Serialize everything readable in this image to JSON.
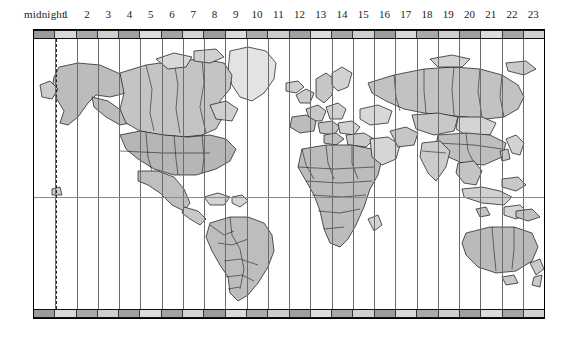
{
  "hour_axis": {
    "labels": [
      "midnight",
      "1",
      "2",
      "3",
      "4",
      "5",
      "6",
      "7",
      "8",
      "9",
      "10",
      "11",
      "12",
      "13",
      "14",
      "15",
      "16",
      "17",
      "18",
      "19",
      "20",
      "21",
      "22",
      "23"
    ],
    "count": 24,
    "first_label_text": "midnight"
  },
  "map": {
    "frame": {
      "x": 33,
      "y": 29,
      "width": 512,
      "height": 290
    },
    "timezone_band_count": 24,
    "equator_label": "equator",
    "date_line_label": "international-date-line",
    "projection": "equirectangular",
    "features": [
      "north-america",
      "south-america",
      "greenland",
      "europe",
      "africa",
      "asia",
      "russia",
      "australia",
      "new-zealand",
      "antarctic-edge"
    ]
  },
  "colors": {
    "land_dark": "#b2b2b2",
    "land_mid": "#c0c0c0",
    "land_light": "#d6d6d6",
    "land_pale": "#e6e6e6",
    "outline": "#111111",
    "grid_line": "#6b6b6b",
    "strip_dark": "#8f8f8f",
    "strip_light": "#d2d2d2",
    "background": "#ffffff",
    "text": "#1a1a1a"
  },
  "strip_cells": [
    "#9a9a9a",
    "#d8d8d8",
    "#a8a8a8",
    "#cfcfcf",
    "#9f9f9f",
    "#dcdcdc",
    "#a3a3a3",
    "#d4d4d4",
    "#9c9c9c",
    "#dadada",
    "#aaaaaa",
    "#cccccc",
    "#a0a0a0",
    "#dedede",
    "#a6a6a6",
    "#d0d0d0",
    "#9d9d9d",
    "#d9d9d9",
    "#a9a9a9",
    "#cdcdcd",
    "#a1a1a1",
    "#dbdbdb",
    "#a5a5a5",
    "#d1d1d1"
  ]
}
